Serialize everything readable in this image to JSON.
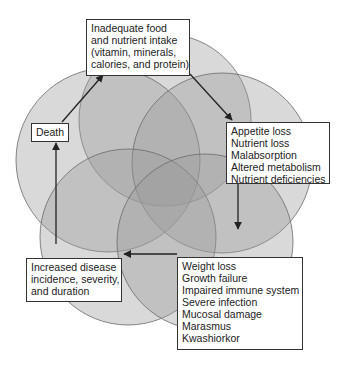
{
  "colors": {
    "circle_fill": "#9a9a9a",
    "circle_stroke": "#6a6a6a",
    "box_border": "#333333",
    "arrow": "#222222",
    "text": "#222222"
  },
  "nodes": {
    "intake": {
      "lines": [
        "Inadequate food",
        "and nutrient intake",
        "(vitamin, minerals,",
        "calories, and protein)"
      ]
    },
    "appetite": {
      "lines": [
        "Appetite loss",
        "Nutrient loss",
        "Malabsorption",
        "Altered metabolism",
        "Nutrient deficiencies"
      ]
    },
    "weight": {
      "lines": [
        "Weight loss",
        "Growth failure",
        "Impaired immune system",
        "Severe infection",
        "Mucosal damage",
        "Marasmus",
        "Kwashiorkor"
      ]
    },
    "disease": {
      "lines": [
        "Increased disease",
        "incidence, severity,",
        "and duration"
      ]
    },
    "death": {
      "lines": [
        "Death"
      ]
    }
  },
  "edges": [
    {
      "from": "intake",
      "to": "appetite"
    },
    {
      "from": "appetite",
      "to": "weight"
    },
    {
      "from": "weight",
      "to": "disease"
    },
    {
      "from": "disease",
      "to": "death"
    },
    {
      "from": "death",
      "to": "intake"
    }
  ]
}
